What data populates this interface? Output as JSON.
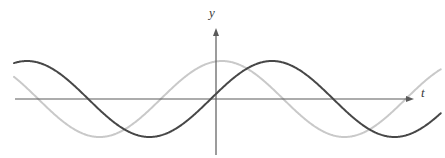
{
  "figure": {
    "name": "two-sinusoids-graph",
    "background_color": "#ffffff",
    "width": 445,
    "height": 158
  },
  "axes": {
    "x_axis": {
      "label": "t",
      "label_style": "italic",
      "color": "#555555",
      "arrow": "right",
      "y_pixel": 99,
      "x_start_pixel": 15,
      "x_end_pixel": 414
    },
    "y_axis": {
      "label": "y",
      "label_style": "italic",
      "color": "#555555",
      "arrow": "up",
      "x_pixel": 216,
      "y_top_pixel": 28,
      "y_bottom_pixel": 155
    },
    "origin": {
      "x": 216,
      "y": 99
    }
  },
  "chart_data": {
    "type": "line",
    "title": "",
    "xlabel": "t",
    "ylabel": "y",
    "grid": false,
    "legend": "none",
    "xlim": [
      -0.8824,
      0.9306
    ],
    "ylim": [
      -1.2,
      1.2
    ],
    "x_pixel_per_unit": 228,
    "amplitude_pixels": 38,
    "period_pixels": 245,
    "series": [
      {
        "name": "dark-wave",
        "color": "#474747",
        "line_width": 2.0,
        "amplitude": 1.0,
        "period": 1.0,
        "phase_peak_x": 27,
        "description": "cosine-like wave, peaks at x=27 and x=272, troughs at x=155 and x=400",
        "key_points_pixels": [
          {
            "x": 14,
            "y": 64
          },
          {
            "x": 27,
            "y": 61
          },
          {
            "x": 92,
            "y": 99
          },
          {
            "x": 155,
            "y": 137
          },
          {
            "x": 216,
            "y": 99
          },
          {
            "x": 272,
            "y": 61
          },
          {
            "x": 339,
            "y": 99
          },
          {
            "x": 402,
            "y": 133
          },
          {
            "x": 440,
            "y": 118
          }
        ]
      },
      {
        "name": "light-wave",
        "color": "#c9c9c9",
        "line_width": 2.0,
        "amplitude": 1.0,
        "period": 1.0,
        "phase_peak_x": 222,
        "description": "same sinusoid shifted right by about 195 pixels, peaks at x=222, troughs at x=95 and x=340",
        "key_points_pixels": [
          {
            "x": 14,
            "y": 80
          },
          {
            "x": 33,
            "y": 99
          },
          {
            "x": 95,
            "y": 136
          },
          {
            "x": 160,
            "y": 99
          },
          {
            "x": 222,
            "y": 60
          },
          {
            "x": 283,
            "y": 99
          },
          {
            "x": 340,
            "y": 134
          },
          {
            "x": 405,
            "y": 99
          },
          {
            "x": 440,
            "y": 79
          }
        ]
      }
    ]
  }
}
